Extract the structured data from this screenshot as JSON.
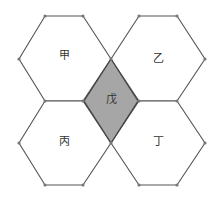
{
  "diagram": {
    "width": 220,
    "height": 202,
    "colors": {
      "hex_fill": "#ffffff",
      "hex_stroke": "#555555",
      "rhombus_fill": "#a6a6a6",
      "rhombus_stroke": "#444444",
      "vertex": "#777777",
      "label": "#333333"
    },
    "hexagons": [
      {
        "id": "jia",
        "label": "甲",
        "label_pos": [
          64,
          56
        ],
        "points": [
          [
            45,
            16
          ],
          [
            83,
            16
          ],
          [
            111,
            59
          ],
          [
            83,
            101
          ],
          [
            45,
            101
          ],
          [
            19,
            59
          ]
        ]
      },
      {
        "id": "yi",
        "label": "乙",
        "label_pos": [
          158,
          59
        ],
        "points": [
          [
            139,
            16
          ],
          [
            177,
            16
          ],
          [
            205,
            59
          ],
          [
            177,
            101
          ],
          [
            139,
            101
          ],
          [
            111,
            59
          ]
        ]
      },
      {
        "id": "bing",
        "label": "丙",
        "label_pos": [
          64,
          142
        ],
        "points": [
          [
            45,
            101
          ],
          [
            83,
            101
          ],
          [
            111,
            143
          ],
          [
            83,
            185
          ],
          [
            45,
            185
          ],
          [
            19,
            143
          ]
        ]
      },
      {
        "id": "ding",
        "label": "丁",
        "label_pos": [
          158,
          142
        ],
        "points": [
          [
            139,
            101
          ],
          [
            177,
            101
          ],
          [
            205,
            143
          ],
          [
            177,
            185
          ],
          [
            139,
            185
          ],
          [
            111,
            143
          ]
        ]
      }
    ],
    "rhombus": {
      "id": "wu",
      "label": "戊",
      "label_pos": [
        111,
        100
      ],
      "points": [
        [
          111,
          59
        ],
        [
          138,
          101
        ],
        [
          111,
          143
        ],
        [
          84,
          101
        ]
      ],
      "shaded": true
    }
  }
}
